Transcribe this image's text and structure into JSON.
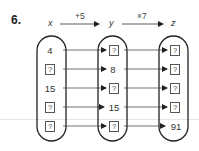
{
  "question_number": "6.",
  "header": {
    "vars": [
      "x",
      "y",
      "z"
    ],
    "ops": [
      "+5",
      "×7"
    ]
  },
  "columns": [
    {
      "name": "x",
      "cells": [
        "4",
        "?",
        "15",
        "?",
        "?"
      ]
    },
    {
      "name": "y",
      "cells": [
        "?",
        "8",
        "?",
        "15",
        "?"
      ]
    },
    {
      "name": "z",
      "cells": [
        "?",
        "?",
        "?",
        "?",
        "91"
      ]
    }
  ],
  "unknown_symbol": "?"
}
